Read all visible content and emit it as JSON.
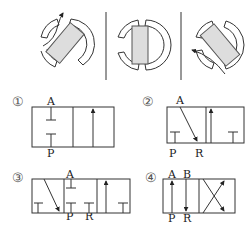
{
  "top_views": {
    "description": "Three rotary valve position views separated by vertical dividers",
    "spool_fill": "#dddddd",
    "views": [
      {
        "id": "left",
        "rotation_deg": -40,
        "flow_arrow": "up-left"
      },
      {
        "id": "center",
        "rotation_deg": 0,
        "flow_arrow": "none"
      },
      {
        "id": "right",
        "rotation_deg": 40,
        "flow_arrow": "left"
      }
    ]
  },
  "options": [
    {
      "number": "①",
      "labels": {
        "top": "A",
        "bottom": "P"
      },
      "positions": 2
    },
    {
      "number": "②",
      "labels": {
        "top": "A",
        "bottom_1": "P",
        "bottom_2": "R"
      },
      "positions": 2
    },
    {
      "number": "③",
      "labels": {
        "top": "A",
        "bottom_1": "P",
        "bottom_2": "R"
      },
      "positions": 3
    },
    {
      "number": "④",
      "labels": {
        "top_1": "A",
        "top_2": "B",
        "bottom_1": "P",
        "bottom_2": "R"
      },
      "positions": 2
    }
  ]
}
